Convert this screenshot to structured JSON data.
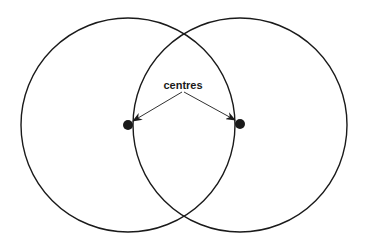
{
  "diagram": {
    "label": "centres",
    "stroke_color": "#1a1a1a",
    "background": "#ffffff",
    "circles": [
      {
        "name": "left-circle",
        "cx": 128,
        "cy": 125,
        "r": 107
      },
      {
        "name": "right-circle",
        "cx": 240,
        "cy": 125,
        "r": 107
      }
    ],
    "centre_points": [
      {
        "name": "left-centre",
        "cx": 128,
        "cy": 125,
        "r": 5
      },
      {
        "name": "right-centre",
        "cx": 240,
        "cy": 124,
        "r": 5
      }
    ],
    "arrows": [
      {
        "name": "arrow-to-left-centre",
        "from": [
          182,
          92
        ],
        "to": [
          132,
          122
        ]
      },
      {
        "name": "arrow-to-right-centre",
        "from": [
          184,
          92
        ],
        "to": [
          236,
          121
        ]
      }
    ]
  }
}
